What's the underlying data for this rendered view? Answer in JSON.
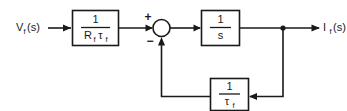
{
  "diagram": {
    "type": "control-block-diagram",
    "colors": {
      "line": "#1a1a1a",
      "background": "#ffffff",
      "block_fill": "#ffffff"
    },
    "input": {
      "label_main": "V",
      "label_sub": "f",
      "label_tail": "(s)",
      "full": "V_f(s)"
    },
    "output": {
      "label_main": "I",
      "label_sub": "f",
      "label_tail": "(s)",
      "full": "I_f(s)"
    },
    "summing_junction": {
      "name": "summing-junction",
      "plus_sign": "+",
      "minus_sign": "−",
      "plus_input": "forward path from gain block",
      "minus_input": "feedback path"
    },
    "blocks": [
      {
        "name": "gain-block",
        "numerator": "1",
        "denominator_main": "R",
        "denominator_sub1": "f",
        "denominator_tau": "τ",
        "denominator_sub2": "f",
        "expression": "1/(R_f τ_f)"
      },
      {
        "name": "integrator-block",
        "numerator": "1",
        "denominator": "s",
        "expression": "1/s"
      },
      {
        "name": "feedback-block",
        "numerator": "1",
        "denominator_tau": "τ",
        "denominator_sub": "f",
        "expression": "1/τ_f"
      }
    ],
    "signal_flow": [
      "V_f(s) → 1/(R_f τ_f) → summing junction (+)",
      "summing junction → 1/s → I_f(s)",
      "I_f(s) takeoff → 1/τ_f → summing junction (−)"
    ]
  }
}
